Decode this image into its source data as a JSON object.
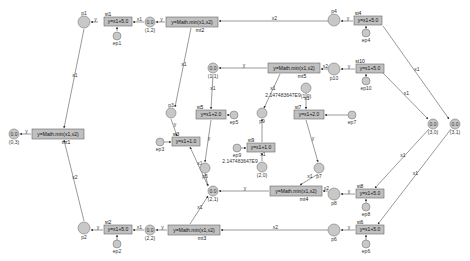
{
  "diagram": {
    "type": "petri-net",
    "places": [
      {
        "id": "p1",
        "label": "p1",
        "x": 84,
        "y": 22,
        "r": 6
      },
      {
        "id": "p2",
        "label": "p2",
        "x": 84,
        "y": 228,
        "r": 6
      },
      {
        "id": "p3",
        "label": "p3",
        "x": 171,
        "y": 113,
        "r": 5
      },
      {
        "id": "p4",
        "label": "p4",
        "x": 334,
        "y": 20,
        "r": 6
      },
      {
        "id": "p5",
        "label": "p5",
        "x": 205,
        "y": 168,
        "r": 5
      },
      {
        "id": "p6",
        "label": "p6",
        "x": 334,
        "y": 230,
        "r": 6
      },
      {
        "id": "p7",
        "label": "p7",
        "x": 319,
        "y": 168,
        "r": 5
      },
      {
        "id": "p8",
        "label": "p8",
        "x": 334,
        "y": 194,
        "r": 6
      },
      {
        "id": "p9",
        "label": "p9",
        "x": 262,
        "y": 113,
        "r": 5
      },
      {
        "id": "p10",
        "label": "p10",
        "x": 334,
        "y": 69,
        "r": 6
      },
      {
        "id": "c12",
        "label": "0.0",
        "sub": "(1,2)",
        "x": 150,
        "y": 22,
        "r": 5
      },
      {
        "id": "c03",
        "label": "0.0",
        "sub": "(0,3)",
        "x": 14,
        "y": 134,
        "r": 5
      },
      {
        "id": "c11",
        "label": "0.0",
        "sub": "(1,1)",
        "x": 213,
        "y": 68,
        "r": 5
      },
      {
        "id": "c20",
        "label": "",
        "sub": "(2,0)",
        "x": 262,
        "y": 167,
        "r": 5
      },
      {
        "id": "c21",
        "label": "0.0",
        "sub": "(2,1)",
        "x": 213,
        "y": 191,
        "r": 5
      },
      {
        "id": "c22",
        "label": "0.0",
        "sub": "(2,2)",
        "x": 150,
        "y": 230,
        "r": 5
      },
      {
        "id": "c30",
        "label": "0.0",
        "sub": "(3,0)",
        "x": 433,
        "y": 124,
        "r": 5
      },
      {
        "id": "c31",
        "label": "0.0",
        "sub": "(3,1)",
        "x": 455,
        "y": 124,
        "r": 5
      },
      {
        "id": "c102",
        "label": "",
        "sub": "(1,0)",
        "x": 306,
        "y": 88,
        "r": 5
      },
      {
        "id": "ep1",
        "label": "ep1",
        "x": 117,
        "y": 36,
        "r": 4
      },
      {
        "id": "ep2",
        "label": "ep2",
        "x": 117,
        "y": 244,
        "r": 4
      },
      {
        "id": "ep3",
        "label": "ep3",
        "x": 160,
        "y": 142,
        "r": 4
      },
      {
        "id": "ep4",
        "label": "ep4",
        "x": 366,
        "y": 33,
        "r": 4
      },
      {
        "id": "ep5",
        "label": "ep5",
        "x": 234,
        "y": 115,
        "r": 4
      },
      {
        "id": "ep6",
        "label": "ep6",
        "x": 366,
        "y": 244,
        "r": 4
      },
      {
        "id": "ep7",
        "label": "ep7",
        "x": 352,
        "y": 115,
        "r": 4
      },
      {
        "id": "ep8",
        "label": "ep8",
        "x": 366,
        "y": 207,
        "r": 4
      },
      {
        "id": "ep9",
        "label": "ep9",
        "x": 237,
        "y": 148,
        "r": 4
      },
      {
        "id": "ep10",
        "label": "ep10",
        "x": 366,
        "y": 81,
        "r": 4
      }
    ],
    "transitions": [
      {
        "id": "st1",
        "label": "st1",
        "text": "y=x1+5.0",
        "x": 104,
        "y": 17,
        "w": 28,
        "h": 9,
        "lpos": "top"
      },
      {
        "id": "st2",
        "label": "st2",
        "text": "y=x1+5.0",
        "x": 104,
        "y": 225,
        "w": 28,
        "h": 9,
        "lpos": "top"
      },
      {
        "id": "st3",
        "label": "st3",
        "text": "y=x1+1.0",
        "x": 172,
        "y": 137,
        "w": 28,
        "h": 9,
        "lpos": "top"
      },
      {
        "id": "st4",
        "label": "st4",
        "text": "y=x1+5.0",
        "x": 354,
        "y": 16,
        "w": 28,
        "h": 9,
        "lpos": "top"
      },
      {
        "id": "st5",
        "label": "st5",
        "text": "y=x1+2.0",
        "x": 196,
        "y": 110,
        "w": 30,
        "h": 9,
        "lpos": "top"
      },
      {
        "id": "st6",
        "label": "st6",
        "text": "y=x1+5.0",
        "x": 356,
        "y": 225,
        "w": 28,
        "h": 9,
        "lpos": "top"
      },
      {
        "id": "st7",
        "label": "st7",
        "text": "y=x1+2.0",
        "x": 294,
        "y": 110,
        "w": 30,
        "h": 9,
        "lpos": "top"
      },
      {
        "id": "st8",
        "label": "st8",
        "text": "y=x1+5.0",
        "x": 356,
        "y": 189,
        "w": 28,
        "h": 9,
        "lpos": "top"
      },
      {
        "id": "st9",
        "label": "st9",
        "text": "y=x1+1.0",
        "x": 247,
        "y": 143,
        "w": 28,
        "h": 9,
        "lpos": "top"
      },
      {
        "id": "st10",
        "label": "st10",
        "text": "y=x1+5.0",
        "x": 356,
        "y": 64,
        "w": 28,
        "h": 9,
        "lpos": "top"
      },
      {
        "id": "mt1",
        "label": "mt1",
        "text": "y=Math.min(x1,x2)",
        "x": 32,
        "y": 129,
        "w": 52,
        "h": 10,
        "lpos": "bottom"
      },
      {
        "id": "mt2",
        "label": "mt2",
        "text": "y=Math.min(x1,x2)",
        "x": 166,
        "y": 17,
        "w": 52,
        "h": 10,
        "lpos": "bottom"
      },
      {
        "id": "mt3",
        "label": "mt3",
        "text": "y=Math.min(x1,x2)",
        "x": 168,
        "y": 225,
        "w": 52,
        "h": 10,
        "lpos": "bottom"
      },
      {
        "id": "mt4",
        "label": "mt4",
        "text": "y=Math.min(x1,x2)",
        "x": 270,
        "y": 186,
        "w": 52,
        "h": 10,
        "lpos": "bottom"
      },
      {
        "id": "mt5",
        "label": "mt5",
        "text": "y=Math.min(x1,x2)",
        "x": 268,
        "y": 63,
        "w": 52,
        "h": 10,
        "lpos": "bottom"
      }
    ],
    "annotations": [
      {
        "text": "2.147483647E9",
        "x": 283,
        "y": 97
      },
      {
        "text": "2.147483647E9",
        "x": 240,
        "y": 163
      }
    ],
    "arcs": [
      {
        "from": [
          98,
          22
        ],
        "to": [
          91,
          22
        ],
        "label": "y"
      },
      {
        "from": [
          144,
          22
        ],
        "to": [
          133,
          22
        ],
        "label": "x1"
      },
      {
        "from": [
          117,
          31
        ],
        "to": [
          117,
          27
        ],
        "label": ""
      },
      {
        "from": [
          165,
          22
        ],
        "to": [
          156,
          22
        ],
        "label": "y"
      },
      {
        "from": [
          328,
          21
        ],
        "to": [
          219,
          21
        ],
        "label": "x2"
      },
      {
        "from": [
          353,
          21
        ],
        "to": [
          341,
          21
        ],
        "label": "y"
      },
      {
        "from": [
          366,
          29
        ],
        "to": [
          366,
          26
        ],
        "label": ""
      },
      {
        "from": [
          84,
          29
        ],
        "to": [
          64,
          128
        ],
        "label": "x1"
      },
      {
        "from": [
          84,
          221
        ],
        "to": [
          64,
          140
        ],
        "label": "x2"
      },
      {
        "from": [
          31,
          134
        ],
        "to": [
          20,
          134
        ],
        "label": "y"
      },
      {
        "from": [
          191,
          28
        ],
        "to": [
          175,
          107
        ],
        "label": "x1"
      },
      {
        "from": [
          103,
          230
        ],
        "to": [
          91,
          230
        ],
        "label": "y"
      },
      {
        "from": [
          144,
          230
        ],
        "to": [
          133,
          230
        ],
        "label": "x1"
      },
      {
        "from": [
          117,
          240
        ],
        "to": [
          117,
          235
        ],
        "label": ""
      },
      {
        "from": [
          167,
          230
        ],
        "to": [
          156,
          230
        ],
        "label": "y"
      },
      {
        "from": [
          328,
          230
        ],
        "to": [
          221,
          230
        ],
        "label": "x2"
      },
      {
        "from": [
          355,
          230
        ],
        "to": [
          341,
          230
        ],
        "label": "y"
      },
      {
        "from": [
          366,
          240
        ],
        "to": [
          366,
          235
        ],
        "label": ""
      },
      {
        "from": [
          171,
          119
        ],
        "to": [
          177,
          136
        ],
        "label": "y"
      },
      {
        "from": [
          164,
          142
        ],
        "to": [
          171,
          142
        ],
        "label": ""
      },
      {
        "from": [
          208,
          186
        ],
        "to": [
          190,
          147
        ],
        "label": "x1"
      },
      {
        "from": [
          205,
          173
        ],
        "to": [
          208,
          186
        ],
        "label": ""
      },
      {
        "from": [
          190,
          224
        ],
        "to": [
          208,
          196
        ],
        "label": "x1"
      },
      {
        "from": [
          213,
          74
        ],
        "to": [
          211,
          109
        ],
        "label": "x1"
      },
      {
        "from": [
          230,
          115
        ],
        "to": [
          227,
          115
        ],
        "label": ""
      },
      {
        "from": [
          211,
          120
        ],
        "to": [
          205,
          162
        ],
        "label": "y"
      },
      {
        "from": [
          267,
          68
        ],
        "to": [
          219,
          68
        ],
        "label": "y"
      },
      {
        "from": [
          328,
          69
        ],
        "to": [
          321,
          69
        ],
        "label": "x2"
      },
      {
        "from": [
          355,
          69
        ],
        "to": [
          341,
          69
        ],
        "label": "y"
      },
      {
        "from": [
          366,
          77
        ],
        "to": [
          366,
          74
        ],
        "label": ""
      },
      {
        "from": [
          280,
          74
        ],
        "to": [
          264,
          108
        ],
        "label": "x1"
      },
      {
        "from": [
          306,
          93
        ],
        "to": [
          306,
          109
        ],
        "label": "x1"
      },
      {
        "from": [
          348,
          115
        ],
        "to": [
          325,
          115
        ],
        "label": ""
      },
      {
        "from": [
          306,
          120
        ],
        "to": [
          318,
          162
        ],
        "label": "y"
      },
      {
        "from": [
          262,
          161
        ],
        "to": [
          262,
          153
        ],
        "label": "x1"
      },
      {
        "from": [
          241,
          148
        ],
        "to": [
          246,
          148
        ],
        "label": ""
      },
      {
        "from": [
          262,
          142
        ],
        "to": [
          262,
          119
        ],
        "label": ""
      },
      {
        "from": [
          269,
          191
        ],
        "to": [
          219,
          191
        ],
        "label": "y"
      },
      {
        "from": [
          318,
          174
        ],
        "to": [
          300,
          185
        ],
        "label": "x1"
      },
      {
        "from": [
          328,
          191
        ],
        "to": [
          323,
          191
        ],
        "label": "x2"
      },
      {
        "from": [
          355,
          194
        ],
        "to": [
          341,
          194
        ],
        "label": "y"
      },
      {
        "from": [
          366,
          203
        ],
        "to": [
          366,
          199
        ],
        "label": ""
      },
      {
        "from": [
          383,
          26
        ],
        "to": [
          449,
          119
        ],
        "label": "x1"
      },
      {
        "from": [
          383,
          73
        ],
        "to": [
          428,
          119
        ],
        "label": "x1"
      },
      {
        "from": [
          429,
          129
        ],
        "to": [
          375,
          188
        ],
        "label": "x1"
      },
      {
        "from": [
          451,
          129
        ],
        "to": [
          378,
          224
        ],
        "label": "x1"
      }
    ]
  }
}
